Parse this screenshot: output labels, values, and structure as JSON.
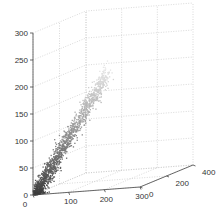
{
  "chart_data": {
    "type": "scatter",
    "dimensions": 3,
    "title": "",
    "xlabel": "",
    "ylabel": "",
    "zlabel": "",
    "xlim": [
      0,
      300
    ],
    "ylim": [
      0,
      400
    ],
    "zlim": [
      0,
      300
    ],
    "x_ticks": [
      "0",
      "100",
      "200",
      "300"
    ],
    "y_ticks": [
      "0",
      "200",
      "400"
    ],
    "z_ticks": [
      "0",
      "50",
      "100",
      "150",
      "200",
      "250",
      "300"
    ],
    "grid": true,
    "grid_style": "dotted",
    "colormap": "gray (colored by z, dark at low z, light at high z)",
    "series": [
      {
        "name": "points",
        "approx_points": [
          {
            "x": 5,
            "y": 5,
            "z": 5
          },
          {
            "x": 15,
            "y": 10,
            "z": 20
          },
          {
            "x": 25,
            "y": 20,
            "z": 35
          },
          {
            "x": 35,
            "y": 30,
            "z": 50
          },
          {
            "x": 45,
            "y": 40,
            "z": 65
          },
          {
            "x": 55,
            "y": 50,
            "z": 80
          },
          {
            "x": 65,
            "y": 60,
            "z": 95
          },
          {
            "x": 75,
            "y": 70,
            "z": 110
          },
          {
            "x": 85,
            "y": 80,
            "z": 125
          },
          {
            "x": 95,
            "y": 90,
            "z": 140
          },
          {
            "x": 110,
            "y": 100,
            "z": 160
          },
          {
            "x": 125,
            "y": 115,
            "z": 180
          },
          {
            "x": 140,
            "y": 130,
            "z": 200
          }
        ]
      }
    ]
  }
}
